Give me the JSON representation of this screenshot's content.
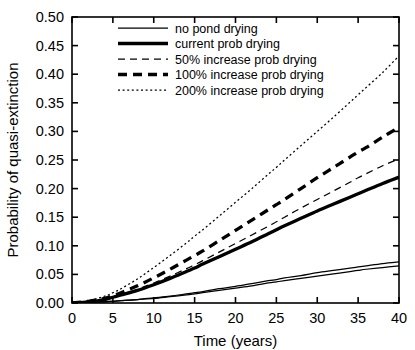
{
  "chart_data": {
    "type": "line",
    "title": "",
    "xlabel": "Time (years)",
    "ylabel": "Probability of quasi-extinction",
    "xlim": [
      0,
      40
    ],
    "ylim": [
      0,
      0.5
    ],
    "xticks": [
      0,
      5,
      10,
      15,
      20,
      25,
      30,
      35,
      40
    ],
    "xtick_labels": [
      "0",
      "5",
      "10",
      "15",
      "20",
      "25",
      "30",
      "35",
      "40"
    ],
    "yticks": [
      0.0,
      0.05,
      0.1,
      0.15,
      0.2,
      0.25,
      0.3,
      0.35,
      0.4,
      0.45,
      0.5
    ],
    "ytick_labels": [
      "0.00",
      "0.05",
      "0.10",
      "0.15",
      "0.20",
      "0.25",
      "0.30",
      "0.35",
      "0.40",
      "0.45",
      "0.50"
    ],
    "grid": false,
    "legend_position": "upper-left",
    "x": [
      0,
      2,
      4,
      5,
      6,
      8,
      10,
      12,
      14,
      15,
      16,
      18,
      20,
      22,
      24,
      25,
      26,
      28,
      30,
      32,
      34,
      35,
      36,
      38,
      40
    ],
    "series": [
      {
        "name": "no pond drying",
        "label": "no pond drying",
        "style": "solid",
        "width": "thin",
        "color": "#000000",
        "values": [
          0.0,
          0.001,
          0.002,
          0.003,
          0.004,
          0.006,
          0.009,
          0.012,
          0.016,
          0.018,
          0.02,
          0.025,
          0.029,
          0.034,
          0.039,
          0.041,
          0.044,
          0.048,
          0.053,
          0.057,
          0.061,
          0.063,
          0.065,
          0.069,
          0.072
        ]
      },
      {
        "name": "no pond drying alternate",
        "label": "no pond drying",
        "style": "solid",
        "width": "thin",
        "color": "#000000",
        "values": [
          0.0,
          0.001,
          0.002,
          0.003,
          0.004,
          0.006,
          0.008,
          0.011,
          0.014,
          0.016,
          0.018,
          0.022,
          0.026,
          0.03,
          0.035,
          0.037,
          0.039,
          0.043,
          0.047,
          0.051,
          0.055,
          0.057,
          0.059,
          0.062,
          0.065
        ]
      },
      {
        "name": "current prob drying",
        "label": "current prob drying",
        "style": "solid",
        "width": "thick",
        "color": "#000000",
        "values": [
          0.0,
          0.002,
          0.006,
          0.01,
          0.014,
          0.022,
          0.032,
          0.043,
          0.055,
          0.061,
          0.068,
          0.081,
          0.094,
          0.107,
          0.121,
          0.128,
          0.135,
          0.148,
          0.161,
          0.173,
          0.185,
          0.191,
          0.197,
          0.209,
          0.22
        ]
      },
      {
        "name": "50% increase prob drying",
        "label": "50% increase prob drying",
        "style": "dashed",
        "width": "thin",
        "color": "#000000",
        "values": [
          0.0,
          0.002,
          0.006,
          0.01,
          0.015,
          0.024,
          0.035,
          0.047,
          0.06,
          0.067,
          0.074,
          0.089,
          0.104,
          0.119,
          0.134,
          0.142,
          0.15,
          0.166,
          0.181,
          0.196,
          0.211,
          0.219,
          0.226,
          0.24,
          0.252
        ]
      },
      {
        "name": "100% increase prob drying",
        "label": "100% increase prob drying",
        "style": "dashed",
        "width": "thick",
        "color": "#000000",
        "values": [
          0.0,
          0.003,
          0.008,
          0.013,
          0.018,
          0.03,
          0.044,
          0.059,
          0.075,
          0.083,
          0.091,
          0.109,
          0.127,
          0.145,
          0.163,
          0.172,
          0.181,
          0.2,
          0.219,
          0.237,
          0.255,
          0.264,
          0.272,
          0.29,
          0.307
        ]
      },
      {
        "name": "200% increase prob drying",
        "label": "200% increase prob drying",
        "style": "dotted",
        "width": "thin",
        "color": "#000000",
        "values": [
          0.0,
          0.004,
          0.012,
          0.018,
          0.025,
          0.042,
          0.062,
          0.083,
          0.105,
          0.117,
          0.128,
          0.152,
          0.176,
          0.2,
          0.225,
          0.237,
          0.25,
          0.275,
          0.3,
          0.325,
          0.351,
          0.364,
          0.377,
          0.403,
          0.432
        ]
      }
    ]
  },
  "legend": {
    "entries": [
      "no pond drying",
      "current prob drying",
      "50% increase prob drying",
      "100% increase prob drying",
      "200% increase prob drying"
    ]
  }
}
